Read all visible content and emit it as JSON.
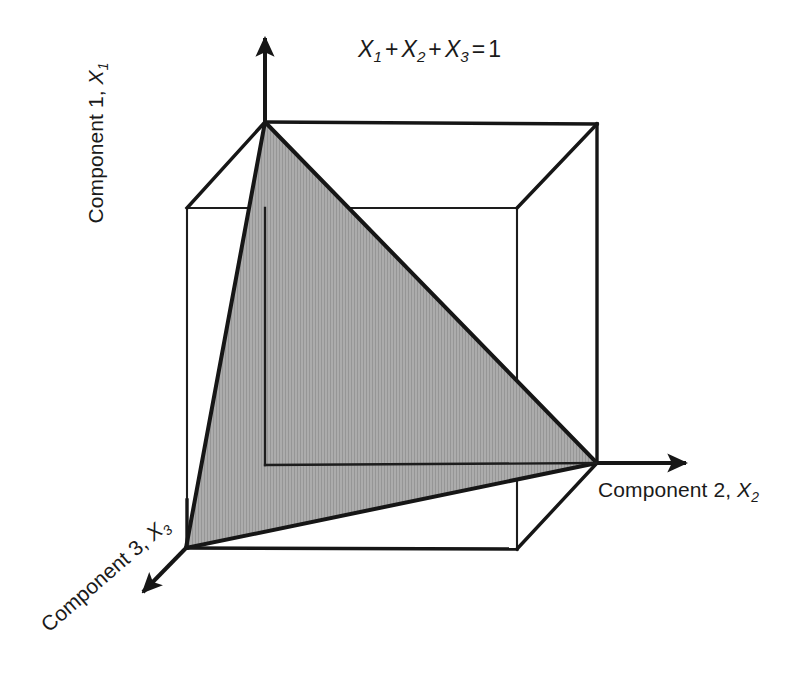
{
  "figure": {
    "title_equation": {
      "terms": [
        "X",
        "X",
        "X"
      ],
      "subscripts": [
        "1",
        "2",
        "3"
      ],
      "plus": "+",
      "equals": "=",
      "result": "1",
      "full_text": "X1 + X2 + X3 = 1"
    },
    "axes": [
      {
        "id": "axis-1",
        "label_prefix": "Component 1,",
        "symbol": "X",
        "subscript": "1",
        "full_text": "Component 1, X1",
        "orientation": "vertical-up"
      },
      {
        "id": "axis-2",
        "label_prefix": "Component 2,",
        "symbol": "X",
        "subscript": "2",
        "full_text": "Component 2, X2",
        "orientation": "horizontal-right"
      },
      {
        "id": "axis-3",
        "label_prefix": "Component 3,",
        "symbol": "X",
        "subscript": "3",
        "full_text": "Component 3, X3",
        "orientation": "diagonal-down-left"
      }
    ],
    "colors": {
      "stroke": "#161616",
      "thin_stroke": "#1d1d1d",
      "simplex_fill": "#a9a9a9",
      "simplex_fill_stripe": "#9a9a9a",
      "background": "#ffffff",
      "text": "#1a1a1a"
    },
    "geometry": {
      "cube_vertices": {
        "near_top_left": [
          265,
          122
        ],
        "far_top_left": [
          187,
          208
        ],
        "far_top_right": [
          517,
          208
        ],
        "near_top_right": [
          597,
          124
        ],
        "near_bottom_left": [
          265,
          465
        ],
        "origin_front_bottom_left": [
          186,
          548
        ],
        "front_bottom_right": [
          517,
          549
        ],
        "far_bottom_right": [
          597,
          463
        ]
      },
      "simplex_triangle": [
        [
          265,
          122
        ],
        [
          186,
          548
        ],
        [
          597,
          463
        ]
      ],
      "axis_arrows": {
        "axis1_tip": [
          265,
          30
        ],
        "axis2_tip": [
          694,
          463
        ],
        "axis3_tip": [
          136,
          599
        ]
      }
    }
  }
}
